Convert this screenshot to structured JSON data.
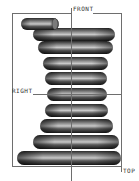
{
  "viewport": {
    "model": "conical-coil-spring",
    "background": "#ffffff",
    "frame_color": "#6e6e6e",
    "datum_planes": [
      {
        "name": "FRONT",
        "label": "FRONT"
      },
      {
        "name": "RIGHT",
        "label": "RIGHT"
      },
      {
        "name": "TOP",
        "label": "TOP"
      }
    ]
  },
  "labels": {
    "front": "FRONT",
    "right": "RIGHT",
    "top": "TOP"
  },
  "spring": {
    "coil_count": 9,
    "shading_dark": "#1e1e1e",
    "shading_mid": "#5a5a5a",
    "shading_light": "#b4b4b4"
  }
}
